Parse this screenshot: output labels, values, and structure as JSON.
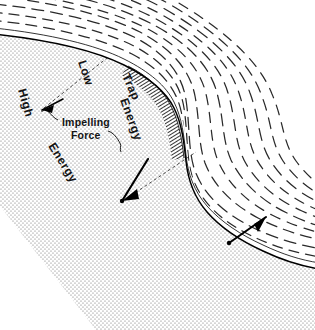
{
  "figure": {
    "domain": "technical-diagram",
    "canvas": {
      "width": 315,
      "height": 330
    },
    "background_color": "#ffffff",
    "ink_color": "#000000"
  },
  "labels": {
    "low": "Low",
    "trap": "Trap",
    "trap_energy": "Energy",
    "high": "High",
    "high_energy": "Energy",
    "impelling_line1": "Impelling",
    "impelling_line2": "Force"
  },
  "regions": [
    {
      "id": "high-energy-region",
      "name": "High Energy",
      "fill_style": "stipple-dots",
      "fill_color": "#6e6e6e",
      "description": "Coarse stippled body occupying the lower-left mass beneath the solid boundary curve"
    },
    {
      "id": "low-energy-region",
      "name": "Low Energy",
      "fill_style": "dashed-flow-lines",
      "fill_color": "#2a2a2a",
      "description": "Field of parallel dashed streamlines above and right of the solid boundary curve"
    },
    {
      "id": "trap-region",
      "name": "Trap Energy",
      "fill_style": "dense-hatch",
      "fill_color": "#141414",
      "description": "Dark crescent of tightly packed short strokes hugging the outside of the upper bend"
    }
  ],
  "annotations": [
    {
      "id": "low-callout",
      "label": "Low",
      "rotation_deg": 72,
      "anchor": {
        "x": 78,
        "y": 62
      }
    },
    {
      "id": "trap-callout",
      "label": "Trap",
      "rotation_deg": 66,
      "anchor": {
        "x": 122,
        "y": 76
      }
    },
    {
      "id": "trap-energy-callout",
      "label": "Energy",
      "rotation_deg": 70,
      "anchor": {
        "x": 120,
        "y": 100
      }
    },
    {
      "id": "high-callout",
      "label": "High",
      "rotation_deg": 74,
      "anchor": {
        "x": 18,
        "y": 90
      }
    },
    {
      "id": "high-energy-callout",
      "label": "Energy",
      "rotation_deg": 58,
      "anchor": {
        "x": 48,
        "y": 146
      }
    },
    {
      "id": "impelling-force-callout",
      "label": "Impelling Force",
      "rotation_deg": 0,
      "anchor": {
        "x": 62,
        "y": 122
      }
    }
  ],
  "arrows": [
    {
      "id": "impelling-force-arrow-upper",
      "from": {
        "x": 62,
        "y": 100
      },
      "to": {
        "x": 41,
        "y": 110
      },
      "direction": "down-left",
      "meaning": "impelling force acting on the upper boundary"
    },
    {
      "id": "impelling-force-arrow-middle",
      "from": {
        "x": 147,
        "y": 160
      },
      "to": {
        "x": 121,
        "y": 202
      },
      "direction": "down-left",
      "meaning": "impelling force acting across the mid bend"
    },
    {
      "id": "impelling-force-arrow-lower",
      "from": {
        "x": 265,
        "y": 218
      },
      "to": {
        "x": 228,
        "y": 243
      },
      "direction": "down-left",
      "meaning": "impelling force acting at the lower boundary"
    }
  ],
  "construction_lines": [
    {
      "id": "upper-datum",
      "style": "dashed",
      "from": {
        "x": 44,
        "y": 108
      },
      "to": {
        "x": 107,
        "y": 58
      }
    },
    {
      "id": "mid-datum",
      "style": "dashed",
      "from": {
        "x": 126,
        "y": 199
      },
      "to": {
        "x": 196,
        "y": 152
      }
    }
  ]
}
